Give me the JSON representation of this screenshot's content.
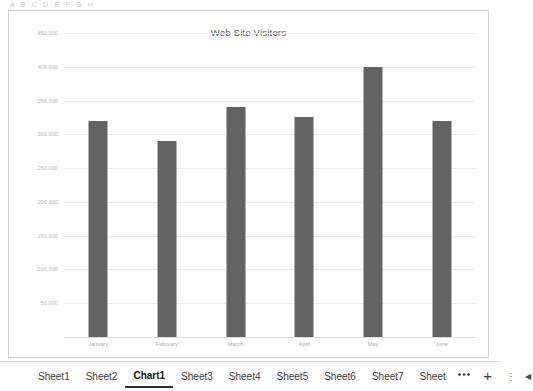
{
  "top_clipped_row": {
    "text": "A B C D E F G H"
  },
  "chart_object": {
    "title": "Web Site Visitors",
    "border_color": "#cfcfcf"
  },
  "chart_data": {
    "type": "bar",
    "title": "Web Site Visitors",
    "xlabel": "",
    "ylabel": "",
    "categories": [
      "January",
      "February",
      "March",
      "April",
      "May",
      "June"
    ],
    "values": [
      320000,
      290000,
      340000,
      325000,
      400000,
      320000
    ],
    "series": [
      {
        "name": "Visitors",
        "values": [
          320000,
          290000,
          340000,
          325000,
          400000,
          320000
        ],
        "color": "#636363"
      }
    ],
    "ylim": [
      0,
      450000
    ],
    "ytick_values": [
      450000,
      400000,
      350000,
      300000,
      250000,
      200000,
      150000,
      100000,
      50000
    ],
    "ytick_labels": [
      "450,000",
      "400,000",
      "350,000",
      "300,000",
      "250,000",
      "200,000",
      "150,000",
      "100,000",
      "50,000"
    ],
    "grid": true,
    "legend": false,
    "legend_position": "none",
    "bar_color": "#636363",
    "gridline_color": "#eceaea"
  },
  "sheet_tabbar": {
    "tabs": [
      {
        "label": "Sheet1",
        "active": false
      },
      {
        "label": "Sheet2",
        "active": false
      },
      {
        "label": "Chart1",
        "active": true
      },
      {
        "label": "Sheet3",
        "active": false
      },
      {
        "label": "Sheet4",
        "active": false
      },
      {
        "label": "Sheet5",
        "active": false
      },
      {
        "label": "Sheet6",
        "active": false
      },
      {
        "label": "Sheet7",
        "active": false
      },
      {
        "label": "Sheet",
        "active": false
      }
    ],
    "overflow_ellipsis": "•••",
    "add_sheet": "+",
    "more_menu": "⋮",
    "scroll_left_arrow": "◀"
  }
}
